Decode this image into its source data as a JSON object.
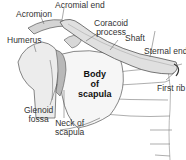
{
  "diagram": {
    "labels": {
      "acromion": "Acromion",
      "acromial_end": "Acromial end",
      "coracoid_process_line1": "Coracoid",
      "coracoid_process_line2": "process",
      "humerus": "Humerus",
      "shaft": "Shaft",
      "sternal_end": "Sternal end",
      "body_line1": "Body",
      "body_line2": "of",
      "body_line3": "scapula",
      "first_rib": "First rib",
      "glenoid_line1": "Glenoid",
      "glenoid_line2": "fossa",
      "neck_line1": "Neck of",
      "neck_line2": "scapula"
    },
    "colors": {
      "bone_fill": "#e4e4e4",
      "bone_shade": "#b8b8b8",
      "outline": "#555555",
      "leader": "#555555"
    }
  }
}
